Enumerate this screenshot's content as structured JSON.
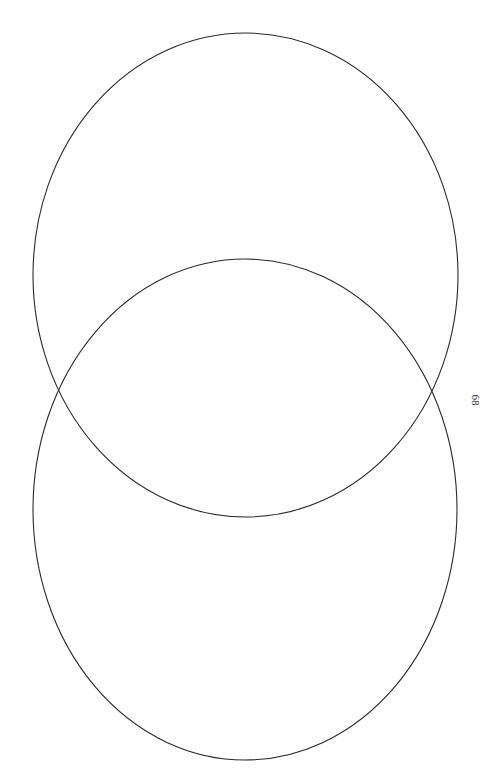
{
  "diagram": {
    "type": "venn",
    "stroke_color": "#2a2a2a",
    "background": "#ffffff",
    "circles": [
      {
        "name": "top-ellipse",
        "cx": 245.5,
        "cy": 275,
        "rx": 212.5,
        "ry": 242,
        "label": ""
      },
      {
        "name": "bottom-ellipse",
        "cx": 245,
        "cy": 509.5,
        "rx": 212,
        "ry": 250.5,
        "label": ""
      }
    ]
  },
  "page": {
    "number": "68"
  }
}
